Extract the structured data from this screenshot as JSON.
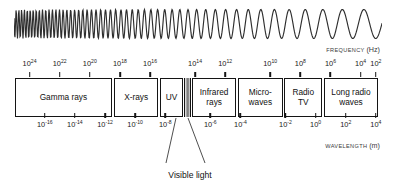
{
  "figure": {
    "background_color": "#ffffff",
    "line_color": "#141414"
  },
  "wave": {
    "name": "electromagnetic-wave-illustration",
    "description": "Sinusoidal wave whose wavelength increases from left to right"
  },
  "frequency_axis": {
    "title_text": "FREQUENCY",
    "title_unit": "(Hz)",
    "ticks": [
      {
        "label": "10",
        "exponent": "24",
        "pos": 4.0
      },
      {
        "label": "10",
        "exponent": "22",
        "pos": 12.3
      },
      {
        "label": "10",
        "exponent": "20",
        "pos": 20.6
      },
      {
        "label": "10",
        "exponent": "18",
        "pos": 28.9
      },
      {
        "label": "10",
        "exponent": "16",
        "pos": 37.2
      },
      {
        "label": "10",
        "exponent": "14",
        "pos": 49.6
      },
      {
        "label": "10",
        "exponent": "12",
        "pos": 57.9
      },
      {
        "label": "10",
        "exponent": "10",
        "pos": 70.3
      },
      {
        "label": "10",
        "exponent": "8",
        "pos": 78.6
      },
      {
        "label": "10",
        "exponent": "6",
        "pos": 86.9
      },
      {
        "label": "10",
        "exponent": "4",
        "pos": 95.2
      },
      {
        "label": "10",
        "exponent": "2",
        "pos": 99.4
      }
    ]
  },
  "wavelength_axis": {
    "title_text": "WAVELENGTH",
    "title_unit": "(m)",
    "ticks": [
      {
        "label": "10",
        "exponent": "-16",
        "pos": 8.2
      },
      {
        "label": "10",
        "exponent": "-14",
        "pos": 16.5
      },
      {
        "label": "10",
        "exponent": "-12",
        "pos": 24.8
      },
      {
        "label": "10",
        "exponent": "-10",
        "pos": 33.1
      },
      {
        "label": "10",
        "exponent": "-8",
        "pos": 41.4
      },
      {
        "label": "10",
        "exponent": "-6",
        "pos": 53.8
      },
      {
        "label": "10",
        "exponent": "-4",
        "pos": 62.1
      },
      {
        "label": "10",
        "exponent": "-2",
        "pos": 74.5
      },
      {
        "label": "10",
        "exponent": "0",
        "pos": 82.8
      },
      {
        "label": "10",
        "exponent": "2",
        "pos": 91.1
      },
      {
        "label": "10",
        "exponent": "4",
        "pos": 99.4
      },
      {
        "label": "10",
        "exponent": "6",
        "pos": 107.0
      }
    ]
  },
  "bands": [
    {
      "id": "gamma-rays",
      "label": "Gamma rays",
      "left": 0.0,
      "width": 36.0,
      "type": "box"
    },
    {
      "id": "x-rays",
      "label": "X-rays",
      "left": 36.8,
      "width": 16.5,
      "type": "box"
    },
    {
      "id": "ultraviolet",
      "label": "UV",
      "left": 54.1,
      "width": 8.3,
      "type": "box"
    },
    {
      "id": "visible-light",
      "label": "",
      "left": 62.8,
      "width": 2.6,
      "type": "gradient"
    },
    {
      "id": "infrared-rays",
      "label": "Infrared\nrays",
      "left": 65.8,
      "width": 16.5,
      "type": "box"
    },
    {
      "id": "microwaves",
      "label": "Micro-\nwaves",
      "left": 83.0,
      "width": 16.5,
      "type": "box"
    },
    {
      "id": "radio-tv",
      "label": "Radio\nTV",
      "left": 100.2,
      "width": 14.0,
      "type": "box"
    },
    {
      "id": "long-radio-waves",
      "label": "Long radio\nwaves",
      "left": 114.9,
      "width": 20.1,
      "type": "box"
    }
  ],
  "visible_light_callout": {
    "caption": "Visible light",
    "leader_left": {
      "x1": 176.0,
      "y1": 118.0,
      "x2": 166.0,
      "y2": 163.0
    },
    "leader_right": {
      "x1": 188.0,
      "y1": 118.0,
      "x2": 205.0,
      "y2": 163.0
    }
  },
  "chart_data": {
    "type": "bar",
    "xlabel": "FREQUENCY (Hz) / WAVELENGTH (m)",
    "ylabel": "",
    "grid": false,
    "legend": "none",
    "categories": [
      "Gamma rays",
      "X-rays",
      "UV",
      "Visible light",
      "Infrared rays",
      "Micro-waves",
      "Radio TV",
      "Long radio waves"
    ],
    "frequency_ticks_hz": [
      "10^24",
      "10^22",
      "10^20",
      "10^18",
      "10^16",
      "10^14",
      "10^12",
      "10^10",
      "10^8",
      "10^6",
      "10^4",
      "10^2"
    ],
    "wavelength_ticks_m": [
      "10^-16",
      "10^-14",
      "10^-12",
      "10^-10",
      "10^-8",
      "10^-6",
      "10^-4",
      "10^-2",
      "10^0",
      "10^2",
      "10^4",
      "10^6"
    ],
    "annotations": [
      "Visible light"
    ]
  }
}
